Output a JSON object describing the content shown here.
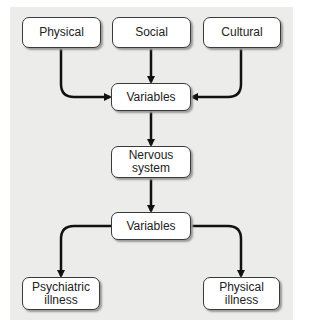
{
  "diagram": {
    "top_row": [
      {
        "label": "Physical"
      },
      {
        "label": "Social"
      },
      {
        "label": "Cultural"
      }
    ],
    "variables_1": {
      "label": "Variables"
    },
    "nervous_system": {
      "label": "Nervous\nsystem"
    },
    "variables_2": {
      "label": "Variables"
    },
    "outcomes": [
      {
        "label": "Psychiatric\nillness"
      },
      {
        "label": "Physical\nillness"
      }
    ],
    "colors": {
      "background_panel": "#ececea",
      "box_fill": "#ffffff",
      "line": "#111111"
    }
  }
}
